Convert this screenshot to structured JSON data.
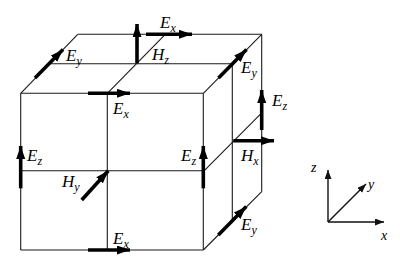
{
  "colors": {
    "background": "#ffffff",
    "line": "#000000"
  },
  "cube_labels": {
    "ex_back_top": {
      "main": "E",
      "sub": "x"
    },
    "hz": {
      "main": "H",
      "sub": "z"
    },
    "ey_top_left": {
      "main": "E",
      "sub": "y"
    },
    "ey_top_right": {
      "main": "E",
      "sub": "y"
    },
    "ex_front_top": {
      "main": "E",
      "sub": "x"
    },
    "ez_back_right": {
      "main": "E",
      "sub": "z"
    },
    "ez_front_left": {
      "main": "E",
      "sub": "z"
    },
    "ez_front_right": {
      "main": "E",
      "sub": "z"
    },
    "hx": {
      "main": "H",
      "sub": "x"
    },
    "hy": {
      "main": "H",
      "sub": "y"
    },
    "ex_front_bottom": {
      "main": "E",
      "sub": "x"
    },
    "ey_bottom_right": {
      "main": "E",
      "sub": "y"
    }
  },
  "axes_labels": {
    "z": "z",
    "y": "y",
    "x": "x"
  }
}
